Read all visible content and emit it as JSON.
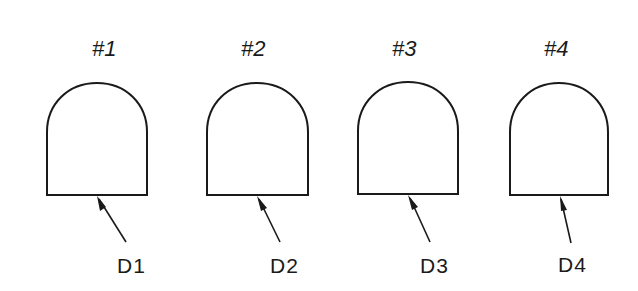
{
  "diagram": {
    "type": "technical-drawing",
    "line_color": "#1a1a1a",
    "background": "#ffffff",
    "items": [
      {
        "title": "#1",
        "label": "D1"
      },
      {
        "title": "#2",
        "label": "D2"
      },
      {
        "title": "#3",
        "label": "D3"
      },
      {
        "title": "#4",
        "label": "D4"
      }
    ]
  }
}
